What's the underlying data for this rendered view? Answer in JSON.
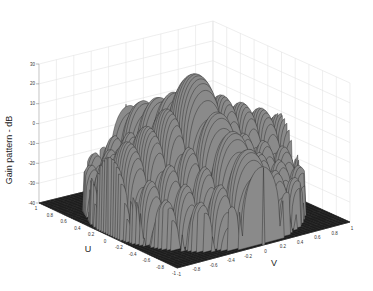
{
  "chart_data": {
    "type": "surface3d",
    "title": "",
    "zlabel": "Gain pattern - dB",
    "xlabel": "U",
    "ylabel": "V",
    "zlim": [
      -40,
      30
    ],
    "z_ticks": [
      "30",
      "20",
      "10",
      "0",
      "-10",
      "-20",
      "-30",
      "-40"
    ],
    "u_ticks": [
      "1",
      "0.8",
      "0.6",
      "0.4",
      "0.2",
      "0",
      "-0.2",
      "-0.4",
      "-0.6",
      "-0.8",
      "-1"
    ],
    "v_ticks": [
      "-1",
      "-0.8",
      "-0.6",
      "-0.4",
      "-0.2",
      "0",
      "0.2",
      "0.4",
      "0.6",
      "0.8",
      "1"
    ],
    "ulim": [
      -1,
      1
    ],
    "vlim": [
      -1,
      1
    ],
    "grid": true,
    "colormap": "gray",
    "peak": {
      "u": 0,
      "v": 0,
      "gain_db": 30
    },
    "floor_db": -40
  },
  "labels": {
    "z_axis": "Gain pattern - dB",
    "u_axis": "U",
    "v_axis": "V"
  }
}
